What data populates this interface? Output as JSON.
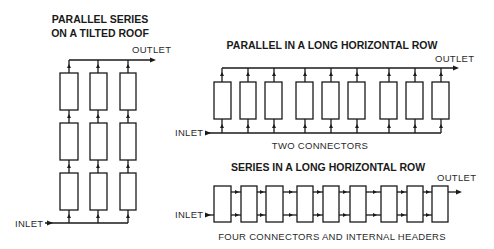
{
  "diagrams": {
    "roof": {
      "title_line1": "PARALLEL SERIES",
      "title_line2": "ON A TILTED ROOF",
      "outlet_label": "OUTLET",
      "inlet_label": "INLET",
      "columns": 3,
      "rows": 3
    },
    "parallel": {
      "title": "PARALLEL IN A LONG HORIZONTAL ROW",
      "outlet_label": "OUTLET",
      "inlet_label": "INLET",
      "caption": "TWO CONNECTORS",
      "collectors": 9
    },
    "series": {
      "title": "SERIES IN A LONG HORIZONTAL ROW",
      "outlet_label": "OUTLET",
      "inlet_label": "INLET",
      "caption": "FOUR CONNECTORS AND INTERNAL HEADERS",
      "collectors": 9
    }
  },
  "colors": {
    "stroke": "#1a1a1a",
    "background": "#ffffff"
  }
}
